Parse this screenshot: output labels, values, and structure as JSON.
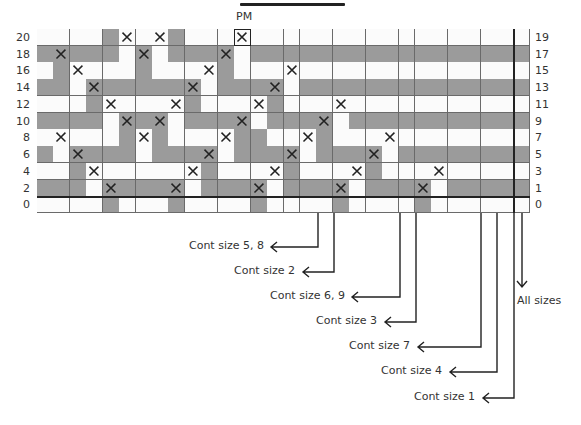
{
  "chart": {
    "marker_label": "PM",
    "left_row_labels": [
      "20",
      "18",
      "16",
      "14",
      "12",
      "10",
      "8",
      "6",
      "4",
      "2",
      "0"
    ],
    "right_row_labels": [
      "19",
      "17",
      "15",
      "13",
      "11",
      "9",
      "7",
      "5",
      "3",
      "1",
      "0"
    ],
    "columns": 30,
    "legend_codes": {
      ".": "white square",
      "#": "gray square",
      "x": "X on white square",
      "X": "X on gray square"
    },
    "rows": [
      "....#x.x#...x.................",
      "#X###.X.###X.#################",
      ".#x...#...x#...x..............",
      "##.X#####X.###X.##############",
      "...#x...x#...x#...x...........",
      "####.X#X.###X.###X.###########",
      ".x...#x#...x##..x#...x........",
      "#.X###.###X.###X.###X.########",
      "..#x.....x#...x#...x#...x.....",
      "###.X###X.###X.###X.###X.#####",
      "....#...#....#....#....#......"
    ],
    "pm_cell": {
      "row": 0,
      "col": 12
    },
    "colors": {
      "gray": "#9b9b9b",
      "white": "#fbfbfb",
      "grid_line": "#6a6a6a",
      "ink": "#222222"
    }
  },
  "callouts": [
    {
      "label": "Cont size 5, 8",
      "line_x": 318,
      "end_y": 247,
      "tip_x": 271,
      "text_right": 264
    },
    {
      "label": "Cont size 2",
      "line_x": 334,
      "end_y": 272,
      "tip_x": 303,
      "text_right": 295
    },
    {
      "label": "Cont size 6, 9",
      "line_x": 400,
      "end_y": 297,
      "tip_x": 352,
      "text_right": 345
    },
    {
      "label": "Cont size 3",
      "line_x": 416,
      "end_y": 322,
      "tip_x": 385,
      "text_right": 377
    },
    {
      "label": "Cont size 7",
      "line_x": 481,
      "end_y": 347,
      "tip_x": 418,
      "text_right": 410
    },
    {
      "label": "Cont size 4",
      "line_x": 497,
      "end_y": 372,
      "tip_x": 450,
      "text_right": 442
    },
    {
      "label": "Cont size 1",
      "line_x": 514,
      "end_y": 398,
      "tip_x": 483,
      "text_right": 475
    }
  ],
  "all_sizes": {
    "label": "All sizes",
    "line_x": 522,
    "end_y": 287
  }
}
